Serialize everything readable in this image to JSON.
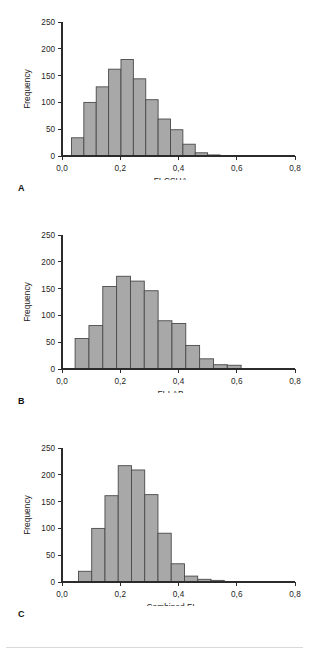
{
  "figure": {
    "background_color": "#ffffff",
    "bar_fill_color": "#a8a8a8",
    "bar_stroke_color": "#4a4a4a",
    "axis_color": "#2b2b2b",
    "panel_count": 3
  },
  "panels": [
    {
      "letter": "A",
      "xlabel": "FI-CSHA",
      "ylabel": "Frequency"
    },
    {
      "letter": "B",
      "xlabel": "FI-LAB",
      "ylabel": "Frequency"
    },
    {
      "letter": "C",
      "xlabel": "Combined FI",
      "ylabel": "Frequency"
    }
  ],
  "chart_data": [
    {
      "type": "bar",
      "title": "",
      "panel_letter": "A",
      "xlabel": "FI-CSHA",
      "ylabel": "Frequency",
      "xlim": [
        0.0,
        0.8
      ],
      "ylim": [
        0,
        250
      ],
      "grid": false,
      "legend": null,
      "xticks": [
        0.0,
        0.2,
        0.4,
        0.6,
        0.8
      ],
      "xticklabels": [
        "0,0",
        "0,2",
        "0,4",
        "0,6",
        "0,8"
      ],
      "yticks": [
        0,
        50,
        100,
        150,
        200,
        250
      ],
      "yticklabels": [
        "0",
        "50",
        "100",
        "150",
        "200",
        "250"
      ],
      "bin_width": 0.0425,
      "bin_starts": [
        0.0325,
        0.075,
        0.1175,
        0.16,
        0.2025,
        0.245,
        0.2875,
        0.33,
        0.3725,
        0.415,
        0.4575,
        0.5,
        0.5425,
        0.585
      ],
      "values": [
        34,
        100,
        129,
        162,
        180,
        144,
        105,
        69,
        49,
        22,
        6,
        2,
        1,
        1
      ]
    },
    {
      "type": "bar",
      "title": "",
      "panel_letter": "B",
      "xlabel": "FI-LAB",
      "ylabel": "Frequency",
      "xlim": [
        0.0,
        0.8
      ],
      "ylim": [
        0,
        250
      ],
      "grid": false,
      "legend": null,
      "xticks": [
        0.0,
        0.2,
        0.4,
        0.6,
        0.8
      ],
      "xticklabels": [
        "0,0",
        "0,2",
        "0,4",
        "0,6",
        "0,8"
      ],
      "yticks": [
        0,
        50,
        100,
        150,
        200,
        250
      ],
      "yticklabels": [
        "0",
        "50",
        "100",
        "150",
        "200",
        "250"
      ],
      "bin_width": 0.0475,
      "bin_starts": [
        0.045,
        0.0925,
        0.14,
        0.1875,
        0.235,
        0.2825,
        0.33,
        0.3775,
        0.425,
        0.4725,
        0.52,
        0.5675
      ],
      "values": [
        57,
        81,
        154,
        173,
        164,
        146,
        90,
        85,
        44,
        19,
        8,
        7
      ]
    },
    {
      "type": "bar",
      "title": "",
      "panel_letter": "C",
      "xlabel": "Combined FI",
      "ylabel": "Frequency",
      "xlim": [
        0.0,
        0.8
      ],
      "ylim": [
        0,
        250
      ],
      "grid": false,
      "legend": null,
      "xticks": [
        0.0,
        0.2,
        0.4,
        0.6,
        0.8
      ],
      "xticklabels": [
        "0,0",
        "0,2",
        "0,4",
        "0,6",
        "0,8"
      ],
      "yticks": [
        0,
        50,
        100,
        150,
        200,
        250
      ],
      "yticklabels": [
        "0",
        "50",
        "100",
        "150",
        "200",
        "250"
      ],
      "bin_width": 0.0455,
      "bin_starts": [
        0.0565,
        0.102,
        0.1475,
        0.193,
        0.2385,
        0.284,
        0.3295,
        0.375,
        0.4205,
        0.466,
        0.5115,
        0.557
      ],
      "values": [
        20,
        100,
        161,
        217,
        209,
        163,
        91,
        34,
        11,
        5,
        3,
        1
      ]
    }
  ]
}
